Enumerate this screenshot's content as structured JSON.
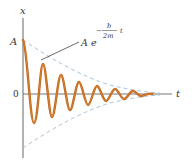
{
  "figure": {
    "axes": {
      "y_label": "x",
      "x_label": "t",
      "y_tick_top": "A",
      "y_tick_origin": "0"
    },
    "annotation": {
      "base": "A e",
      "exponent_sign": "−",
      "exponent_numerator": "b",
      "exponent_denominator": "2m",
      "exponent_variable": "t"
    },
    "colors": {
      "curve": "#c0651e",
      "curve_highlight": "#e8a040",
      "envelope": "#a9c6dc",
      "axis": "#555555",
      "leader": "#444444"
    }
  }
}
